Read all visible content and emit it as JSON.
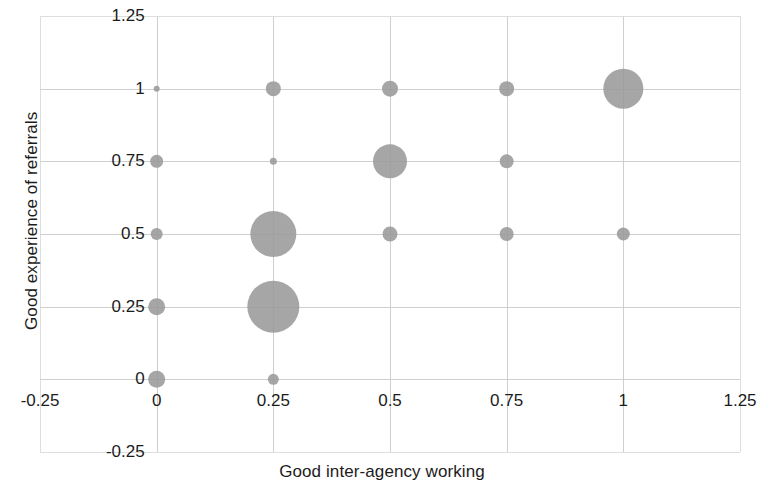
{
  "chart_data": {
    "type": "scatter",
    "title": "",
    "subtitle": "",
    "xlabel": "Good inter-agency working",
    "ylabel": "Good experience of referrals",
    "xlim": [
      -0.25,
      1.25
    ],
    "ylim": [
      -0.25,
      1.25
    ],
    "xticks": [
      "-0.25",
      "0",
      "0.25",
      "0.5",
      "0.75",
      "1",
      "1.25"
    ],
    "xtick_values": [
      -0.25,
      0,
      0.25,
      0.5,
      0.75,
      1,
      1.25
    ],
    "yticks": [
      "-0.25",
      "0",
      "0.25",
      "0.5",
      "0.75",
      "1",
      "1.25"
    ],
    "ytick_values": [
      -0.25,
      0,
      0.25,
      0.5,
      0.75,
      1,
      1.25
    ],
    "grid": true,
    "legend": null,
    "legend_position": "none",
    "marker_color": "#9a9a9a",
    "marker_shape": "circle",
    "size_encoding": "count of observations at each coordinate",
    "points": [
      {
        "x": 0,
        "y": 1,
        "size": 6
      },
      {
        "x": 0.25,
        "y": 1,
        "size": 15
      },
      {
        "x": 0.5,
        "y": 1,
        "size": 16
      },
      {
        "x": 0.75,
        "y": 1,
        "size": 15
      },
      {
        "x": 1,
        "y": 1,
        "size": 40
      },
      {
        "x": 0,
        "y": 0.75,
        "size": 13
      },
      {
        "x": 0.25,
        "y": 0.75,
        "size": 7
      },
      {
        "x": 0.5,
        "y": 0.75,
        "size": 34
      },
      {
        "x": 0.75,
        "y": 0.75,
        "size": 14
      },
      {
        "x": 0,
        "y": 0.5,
        "size": 12
      },
      {
        "x": 0.25,
        "y": 0.5,
        "size": 46
      },
      {
        "x": 0.5,
        "y": 0.5,
        "size": 15
      },
      {
        "x": 0.75,
        "y": 0.5,
        "size": 14
      },
      {
        "x": 1,
        "y": 0.5,
        "size": 13
      },
      {
        "x": 0,
        "y": 0.25,
        "size": 17
      },
      {
        "x": 0.25,
        "y": 0.25,
        "size": 52
      },
      {
        "x": 0,
        "y": 0,
        "size": 17
      },
      {
        "x": 0.25,
        "y": 0,
        "size": 11
      }
    ]
  }
}
